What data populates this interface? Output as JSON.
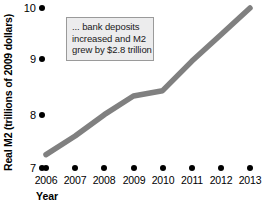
{
  "chart_data": {
    "type": "line",
    "title": "",
    "subtitle": "",
    "xlabel": "Year",
    "ylabel": "Real M2 (trillions of 2009 dollars)",
    "categories": [
      "2006",
      "2007",
      "2008",
      "2009",
      "2010",
      "2011",
      "2012",
      "2013"
    ],
    "x": [
      2006,
      2007,
      2008,
      2009,
      2010,
      2011,
      2012,
      2013
    ],
    "values": [
      7.25,
      7.6,
      8.0,
      8.35,
      8.45,
      9.0,
      9.5,
      10.0
    ],
    "series": [
      {
        "name": "Real M2",
        "values": [
          7.25,
          7.6,
          8.0,
          8.35,
          8.45,
          9.0,
          9.5,
          10.0
        ],
        "color": "#808080"
      }
    ],
    "ylim": [
      7,
      10
    ],
    "xlim": [
      2006,
      2013
    ],
    "y_ticks": [
      7,
      8,
      9,
      10
    ],
    "y_tick_labels": [
      "7",
      "8",
      "9",
      "10"
    ],
    "x_ticks": [
      2006,
      2007,
      2008,
      2009,
      2010,
      2011,
      2012,
      2013
    ],
    "x_tick_labels": [
      "2006",
      "2007",
      "2008",
      "2009",
      "2010",
      "2011",
      "2012",
      "2013"
    ],
    "grid": false,
    "legend": false,
    "legend_position": "none",
    "annotations": [
      {
        "name": "m2-growth-callout",
        "lines": [
          "... bank deposits",
          "increased and M2",
          "grew by $2.8 trillion"
        ],
        "text": "... bank deposits increased and M2 grew by $2.8 trillion",
        "background": "#ececed",
        "border_color": "#9a9a9a"
      }
    ],
    "marker_style": "axis-tick-dots",
    "tick_dot_color": "#000000",
    "line_color": "#808080",
    "line_width": 5.5,
    "background": "#ffffff"
  }
}
